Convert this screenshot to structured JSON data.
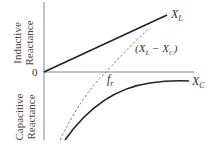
{
  "diagram": {
    "type": "reactance-vs-frequency",
    "y_axis": {
      "upper_label_line1": "Inductive",
      "upper_label_line2": "Reactance",
      "lower_label_line1": "Capacitive",
      "lower_label_line2": "Reactance",
      "origin_label": "0"
    },
    "curves": [
      {
        "name": "X_L",
        "label_main": "X",
        "label_sub": "L",
        "style": "solid"
      },
      {
        "name": "X_C",
        "label_main": "X",
        "label_sub": "C",
        "style": "solid"
      },
      {
        "name": "(X_L - X_C)",
        "label_open": "(X",
        "label_sub1": "L",
        "label_mid": " − X",
        "label_sub2": "C",
        "label_close": ")",
        "style": "dashed"
      }
    ],
    "resonance": {
      "label_main": "f",
      "label_sub": "r"
    },
    "colors": {
      "axis": "#888888",
      "curve": "#222222",
      "dashed": "#777777"
    }
  }
}
